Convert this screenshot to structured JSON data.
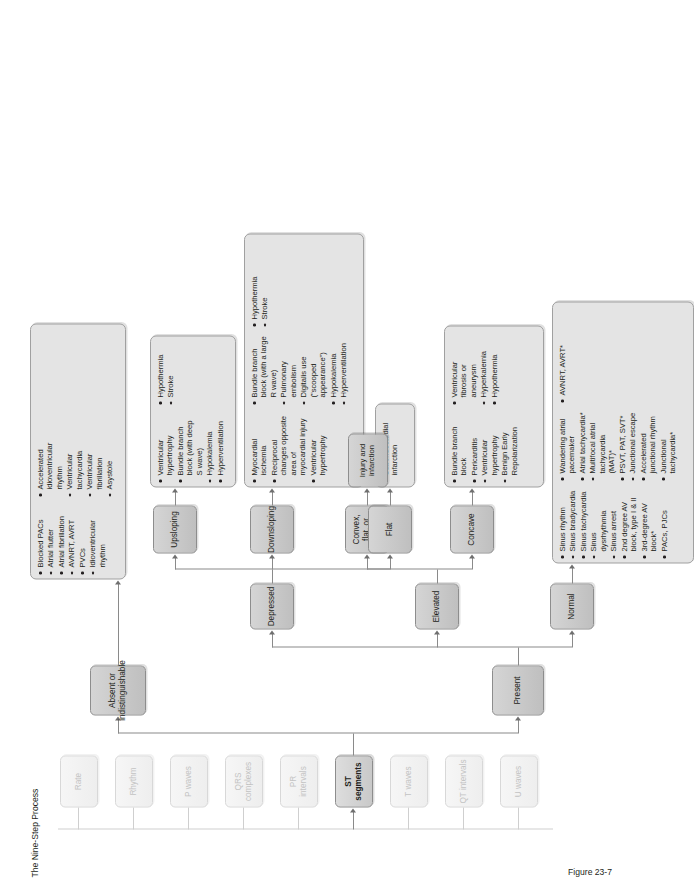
{
  "figure": {
    "title": "The Nine-Step Process",
    "caption": "Figure 23-7",
    "footnote": "*Often distorted"
  },
  "spine": {
    "label": "nine-step-spine",
    "items": [
      {
        "id": "rate",
        "label": "Rate",
        "state": "inactive"
      },
      {
        "id": "rhythm",
        "label": "Rhythm",
        "state": "inactive"
      },
      {
        "id": "p-waves",
        "label": "P waves",
        "state": "inactive"
      },
      {
        "id": "qrs-complexes",
        "label": "QRS complexes",
        "state": "inactive"
      },
      {
        "id": "pr-intervals",
        "label": "PR intervals",
        "state": "inactive"
      },
      {
        "id": "st-segments",
        "label": "ST segments",
        "state": "active"
      },
      {
        "id": "t-waves",
        "label": "T waves",
        "state": "inactive"
      },
      {
        "id": "qt-intervals",
        "label": "QT intervals",
        "state": "inactive"
      },
      {
        "id": "u-waves",
        "label": "U waves",
        "state": "inactive"
      }
    ]
  },
  "branches": {
    "absent": {
      "label": "Absent or indistinguishable"
    },
    "present": {
      "label": "Present"
    },
    "normal": {
      "label": "Normal"
    },
    "elevated": {
      "label": "Elevated"
    },
    "depressed": {
      "label": "Depressed"
    },
    "concave": {
      "label": "Concave"
    },
    "convex": {
      "label": "Convex, flat, or arched"
    },
    "flat": {
      "label": "Flat"
    },
    "downsloping": {
      "label": "Downsloping"
    },
    "upsloping": {
      "label": "Upsloping"
    }
  },
  "lists": {
    "absent": [
      "Blocked PACs",
      "Atrial flutter",
      "Atrial fibrillation",
      "AVNRT, AVRT",
      "PVCs",
      "Idioventricular rhythm",
      "Accelerated idioventricular rhythm",
      "Ventricular tachycardia",
      "Ventricular fibrillation",
      "Asystole"
    ],
    "normal": [
      "Sinus rhythm",
      "Sinus bradycardia",
      "Sinus tachycardia",
      "Sinus dysrhythmia",
      "Sinus arrest",
      "2nd degree AV block, type I & II",
      "3rd-degree AV block*",
      "PACs, PJCs",
      "Wandering atrial pacemaker",
      "Atrial tachycardia*",
      "Multifocal atrial tachycardia (MAT)*",
      "PSVT, PAT, SVT*",
      "Junctional escape",
      "Accelerated junctional rhythm",
      "Junctional tachycardia*",
      "AVNRT, AVRT*"
    ],
    "concave": [
      "Bundle branch block",
      "Pericarditis",
      "Ventricular hypertrophy",
      "Benign Early Repolarization",
      "Ventricular fibrosis or aneurysm",
      "Hyperkalemia",
      "Hypothermia"
    ],
    "convex": [
      "Injury and infarction"
    ],
    "flat": [
      "Subendocardial infarction"
    ],
    "downsloping": [
      "Myocardial ischemia",
      "Reciprocal changes opposite area of myocardial injury",
      "Ventricular hypertrophy",
      "Bundle branch block (with a large R wave)",
      "Pulmonary embolism",
      "Digitalis use (\"scooped appearance\")",
      "Hypokalemia",
      "Hyperventilation",
      "Hypothermia",
      "Stroke"
    ],
    "upsloping": [
      "Ventricular hypertrophy",
      "Bundle branch block (with deep S wave)",
      "Hypokalemia",
      "Hyperventilation",
      "Hypothermia",
      "Stroke"
    ]
  }
}
